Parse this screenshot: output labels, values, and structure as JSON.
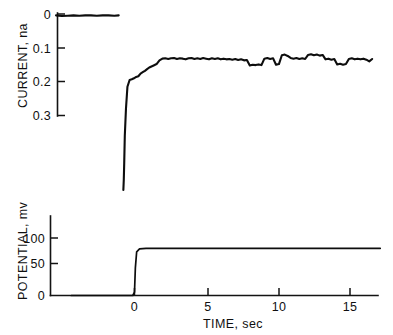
{
  "figure": {
    "background": "#ffffff",
    "ink_color": "#0d0d0d",
    "panel_count": 2
  },
  "chart_data": [
    {
      "type": "line",
      "id": "current-panel",
      "title": "",
      "xlabel": "",
      "ylabel": "CURRENT, na",
      "ylim": [
        0.335,
        0.0
      ],
      "y_inverted": true,
      "xlim": [
        -4.5,
        17.5
      ],
      "grid": false,
      "legend": null,
      "yticks": [
        0,
        0.1,
        0.2,
        0.3
      ],
      "ytick_labels": [
        "0",
        "0.1",
        "0.2",
        "0.3"
      ],
      "xticks": [],
      "xtick_labels": [],
      "series": [
        {
          "name": "baseline",
          "comment": "flat pre-step baseline near 0 nA",
          "x": [
            -4.3,
            -3.9,
            -3.5,
            -3.1,
            -2.7,
            -2.3,
            -1.9,
            -1.5,
            -1.1,
            -0.7,
            -0.3,
            0.0
          ],
          "values": [
            0.004,
            0.006,
            0.005,
            0.004,
            0.005,
            0.004,
            0.004,
            0.005,
            0.004,
            0.004,
            0.005,
            0.004
          ]
        },
        {
          "name": "current-response",
          "comment": "sharp cathodic spike off-scale then stepwise recovery to noisy plateau near 0.13 nA",
          "x": [
            0.02,
            0.05,
            0.08,
            0.12,
            0.2,
            0.3,
            0.45,
            0.6,
            0.75,
            0.9,
            1.05,
            1.2,
            1.35,
            1.5,
            1.65,
            1.8,
            1.95,
            2.1,
            2.3,
            2.5,
            2.7,
            2.9,
            3.1,
            3.3,
            3.5,
            3.7,
            3.9,
            4.1,
            4.3,
            4.5,
            4.7,
            4.9,
            5.1,
            5.3,
            5.5,
            5.7,
            5.9,
            6.1,
            6.3,
            6.5,
            6.7,
            6.9,
            7.1,
            7.3,
            7.5,
            7.7,
            7.9,
            8.1,
            8.3,
            8.5,
            8.7,
            8.9,
            9.1,
            9.3,
            9.5,
            9.7,
            9.9,
            10.1,
            10.3,
            10.5,
            10.7,
            10.9,
            11.1,
            11.3,
            11.5,
            11.7,
            11.9,
            12.1,
            12.3,
            12.5,
            12.7,
            12.9,
            13.1,
            13.3,
            13.5,
            13.7,
            13.9,
            14.1,
            14.3,
            14.5,
            14.7,
            14.9,
            15.1,
            15.3,
            15.5,
            15.7,
            15.9,
            16.1,
            16.3,
            16.5,
            16.7,
            16.9,
            17.1
          ],
          "values": [
            0.52,
            0.49,
            0.44,
            0.36,
            0.28,
            0.215,
            0.195,
            0.193,
            0.19,
            0.186,
            0.184,
            0.176,
            0.172,
            0.168,
            0.163,
            0.158,
            0.155,
            0.152,
            0.148,
            0.137,
            0.132,
            0.131,
            0.133,
            0.131,
            0.13,
            0.133,
            0.131,
            0.132,
            0.134,
            0.131,
            0.13,
            0.133,
            0.131,
            0.133,
            0.13,
            0.132,
            0.134,
            0.131,
            0.133,
            0.131,
            0.134,
            0.132,
            0.134,
            0.133,
            0.135,
            0.133,
            0.136,
            0.134,
            0.137,
            0.136,
            0.152,
            0.15,
            0.151,
            0.149,
            0.151,
            0.132,
            0.13,
            0.133,
            0.131,
            0.15,
            0.148,
            0.122,
            0.12,
            0.124,
            0.13,
            0.132,
            0.13,
            0.133,
            0.131,
            0.133,
            0.121,
            0.119,
            0.122,
            0.12,
            0.123,
            0.121,
            0.134,
            0.132,
            0.135,
            0.133,
            0.149,
            0.147,
            0.15,
            0.148,
            0.133,
            0.131,
            0.134,
            0.132,
            0.134,
            0.132,
            0.135,
            0.14,
            0.133
          ]
        }
      ]
    },
    {
      "type": "line",
      "id": "potential-panel",
      "title": "",
      "xlabel": "TIME, sec",
      "ylabel": "POTENTIAL, mv",
      "ylim": [
        0,
        118
      ],
      "xlim": [
        -4.5,
        17.5
      ],
      "grid": false,
      "legend": null,
      "yticks": [
        0,
        50,
        100
      ],
      "ytick_labels": [
        "0",
        "50",
        "100"
      ],
      "xticks": [
        0,
        5,
        10,
        15
      ],
      "xtick_labels": [
        "0",
        "5",
        "10",
        "15"
      ],
      "series": [
        {
          "name": "potential-step",
          "comment": "potential step from 0 mV to approximately 82 mV at t = 0 s",
          "x": [
            -4.4,
            -2.0,
            -0.6,
            -0.12,
            0.0,
            0.06,
            0.15,
            0.35,
            0.8,
            2.0,
            5.0,
            8.0,
            11.0,
            14.0,
            17.1
          ],
          "values": [
            0,
            0,
            0,
            0,
            6,
            48,
            76,
            81,
            82,
            82,
            82,
            82,
            82,
            82,
            82
          ]
        }
      ]
    }
  ]
}
